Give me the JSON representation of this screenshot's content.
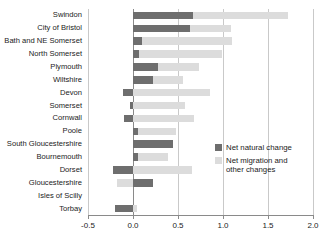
{
  "chart_data": {
    "type": "bar",
    "orientation": "horizontal",
    "stacked": true,
    "title": "",
    "xlabel": "",
    "ylabel": "",
    "xlim": [
      -0.5,
      2.0
    ],
    "xticks": [
      "-0.5",
      "0.0",
      "0.5",
      "1.0",
      "1.5",
      "2.0"
    ],
    "xtick_values": [
      -0.5,
      0.0,
      0.5,
      1.0,
      1.5,
      2.0
    ],
    "grid": true,
    "legend_position": "inside-right",
    "categories": [
      "Swindon",
      "City of Bristol",
      "Bath and NE Somerset",
      "North Somerset",
      "Plymouth",
      "Wiltshire",
      "Devon",
      "Somerset",
      "Cornwall",
      "Poole",
      "South Gloucestershire",
      "Bournemouth",
      "Dorset",
      "Gloucestershire",
      "Isles of Scilly",
      "Torbay"
    ],
    "series": [
      {
        "name": "Net natural change",
        "color": "#6e6e6e",
        "values": [
          0.67,
          0.63,
          0.1,
          0.07,
          0.28,
          0.22,
          -0.11,
          -0.03,
          -0.1,
          0.05,
          0.44,
          0.05,
          -0.22,
          0.22,
          0.0,
          -0.2
        ]
      },
      {
        "name": "Net migration and other changes",
        "color": "#dcdcdc",
        "values": [
          1.05,
          0.46,
          1.0,
          0.92,
          0.45,
          0.34,
          0.86,
          0.58,
          0.68,
          0.43,
          0.0,
          0.34,
          0.66,
          -0.18,
          0.0,
          0.04
        ]
      }
    ],
    "legend": [
      {
        "label": "Net natural change",
        "color": "#6e6e6e"
      },
      {
        "label": "Net migration and other changes",
        "color": "#dcdcdc"
      }
    ]
  },
  "colors": {
    "natural": "#6e6e6e",
    "migration": "#dcdcdc",
    "gridline": "#c9c9c9",
    "axis": "#8a8a8a",
    "text": "#1b1b1b",
    "background": "#ffffff"
  }
}
